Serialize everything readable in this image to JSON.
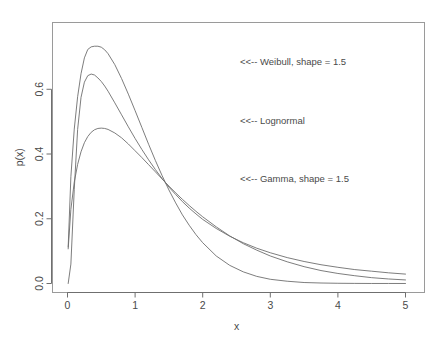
{
  "chart_data": {
    "type": "line",
    "title": "",
    "subtitle": "",
    "xlabel": "x",
    "ylabel": "p(x)",
    "xlim": [
      0,
      5
    ],
    "ylim": [
      0,
      0.78
    ],
    "grid": false,
    "legend_position": "inline-annotations",
    "x_ticks": [
      "0",
      "1",
      "2",
      "3",
      "4",
      "5"
    ],
    "x_tick_values": [
      0,
      1,
      2,
      3,
      4,
      5
    ],
    "y_ticks": [
      "0.0",
      "0.2",
      "0.4",
      "0.6"
    ],
    "y_tick_values": [
      0.0,
      0.2,
      0.4,
      0.6
    ],
    "x": [
      0.01,
      0.05,
      0.1,
      0.15,
      0.2,
      0.25,
      0.3,
      0.35,
      0.4,
      0.45,
      0.5,
      0.55,
      0.6,
      0.7,
      0.8,
      0.9,
      1.0,
      1.1,
      1.2,
      1.3,
      1.4,
      1.5,
      1.6,
      1.7,
      1.8,
      1.9,
      2.0,
      2.2,
      2.4,
      2.6,
      2.8,
      3.0,
      3.25,
      3.5,
      3.75,
      4.0,
      4.25,
      4.5,
      4.75,
      5.0
    ],
    "series": [
      {
        "name": "Weibull, shape = 1.5",
        "annotation": "<<-- Weibull, shape = 1.5",
        "peak_x": 0.5,
        "peak_y": 0.73,
        "values": [
          0.113,
          0.33,
          0.477,
          0.577,
          0.648,
          0.697,
          0.723,
          0.731,
          0.733,
          0.733,
          0.73,
          0.722,
          0.71,
          0.676,
          0.633,
          0.585,
          0.534,
          0.482,
          0.43,
          0.38,
          0.333,
          0.289,
          0.249,
          0.212,
          0.18,
          0.151,
          0.126,
          0.085,
          0.056,
          0.036,
          0.022,
          0.013,
          0.007,
          0.003,
          0.0015,
          0.0007,
          0.0003,
          0.0001,
          5e-05,
          2e-05
        ]
      },
      {
        "name": "Lognormal",
        "annotation": "<<-- Lognormal",
        "peak_x": 0.38,
        "peak_y": 0.65,
        "values": [
          0.0,
          0.06,
          0.291,
          0.476,
          0.575,
          0.622,
          0.642,
          0.647,
          0.644,
          0.635,
          0.624,
          0.61,
          0.594,
          0.558,
          0.521,
          0.484,
          0.448,
          0.414,
          0.382,
          0.352,
          0.324,
          0.298,
          0.275,
          0.253,
          0.233,
          0.215,
          0.198,
          0.17,
          0.146,
          0.126,
          0.109,
          0.095,
          0.08,
          0.068,
          0.058,
          0.05,
          0.043,
          0.038,
          0.033,
          0.029
        ]
      },
      {
        "name": "Gamma, shape = 1.5",
        "annotation": "<<-- Gamma, shape = 1.5",
        "peak_x": 0.5,
        "peak_y": 0.48,
        "values": [
          0.107,
          0.229,
          0.313,
          0.368,
          0.407,
          0.435,
          0.454,
          0.467,
          0.475,
          0.479,
          0.48,
          0.479,
          0.476,
          0.465,
          0.45,
          0.431,
          0.41,
          0.389,
          0.367,
          0.345,
          0.323,
          0.301,
          0.28,
          0.26,
          0.241,
          0.223,
          0.206,
          0.175,
          0.147,
          0.123,
          0.103,
          0.085,
          0.067,
          0.052,
          0.04,
          0.031,
          0.024,
          0.018,
          0.014,
          0.011
        ]
      }
    ],
    "annotations": [
      {
        "text": "<<-- Weibull, shape = 1.5",
        "x": 2.55,
        "y": 0.685
      },
      {
        "text": "<<-- Lognormal",
        "x": 2.55,
        "y": 0.505
      },
      {
        "text": "<<-- Gamma, shape = 1.5",
        "x": 2.55,
        "y": 0.325
      }
    ]
  }
}
